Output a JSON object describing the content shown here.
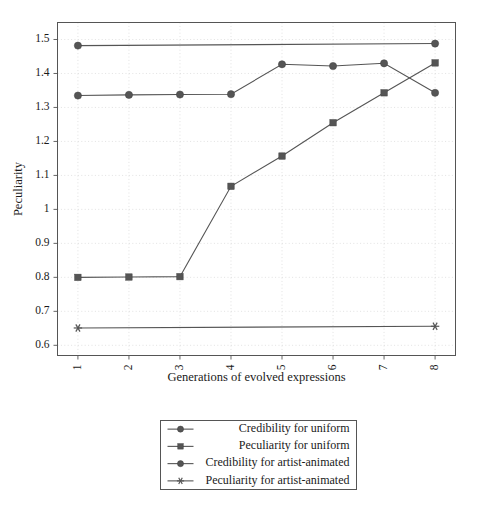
{
  "chart_data": {
    "type": "line",
    "title": "",
    "xlabel": "Generations of evolved expressions",
    "ylabel": "Peculiarity",
    "categories": [
      "1",
      "2",
      "3",
      "4",
      "5",
      "6",
      "7",
      "8"
    ],
    "x": [
      1,
      2,
      3,
      4,
      5,
      6,
      7,
      8
    ],
    "xlim": [
      0.6,
      8.4
    ],
    "ylim": [
      0.57,
      1.55
    ],
    "yticks": [
      "0.6",
      "0.7",
      "0.8",
      "0.9",
      "1",
      "1.1",
      "1.2",
      "1.3",
      "1.4",
      "1.5"
    ],
    "ytick_values": [
      0.6,
      0.7,
      0.8,
      0.9,
      1.0,
      1.1,
      1.2,
      1.3,
      1.4,
      1.5
    ],
    "grid": true,
    "legend_position": "below",
    "series": [
      {
        "name": "Credibility for uniform",
        "marker": "circle",
        "color": "#555555",
        "markers_at_all_points": true,
        "values": [
          1.335,
          1.337,
          1.338,
          1.339,
          1.427,
          1.422,
          1.43,
          1.343
        ]
      },
      {
        "name": "Peculiarity for uniform",
        "marker": "square",
        "color": "#555555",
        "markers_at_all_points": true,
        "values": [
          0.8,
          0.801,
          0.802,
          1.068,
          1.157,
          1.255,
          1.343,
          1.431
        ]
      },
      {
        "name": "Credibility for artist-animated",
        "marker": "circle",
        "color": "#555555",
        "markers_at_all_points": false,
        "values": [
          1.482,
          null,
          null,
          null,
          null,
          null,
          null,
          1.488
        ]
      },
      {
        "name": "Peculiarity for artist-animated",
        "marker": "star",
        "color": "#555555",
        "markers_at_all_points": false,
        "values": [
          0.651,
          null,
          null,
          null,
          null,
          null,
          null,
          0.656
        ]
      }
    ]
  },
  "legend": {
    "entries": [
      {
        "label": "Credibility for uniform",
        "marker": "circle"
      },
      {
        "label": "Peculiarity for uniform",
        "marker": "square"
      },
      {
        "label": "Credibility for artist-animated",
        "marker": "circle"
      },
      {
        "label": "Peculiarity for artist-animated",
        "marker": "star"
      }
    ]
  },
  "colors": {
    "series": "#555555",
    "frame": "#555555",
    "grid": "#cfcfcf",
    "background": "#ffffff"
  }
}
